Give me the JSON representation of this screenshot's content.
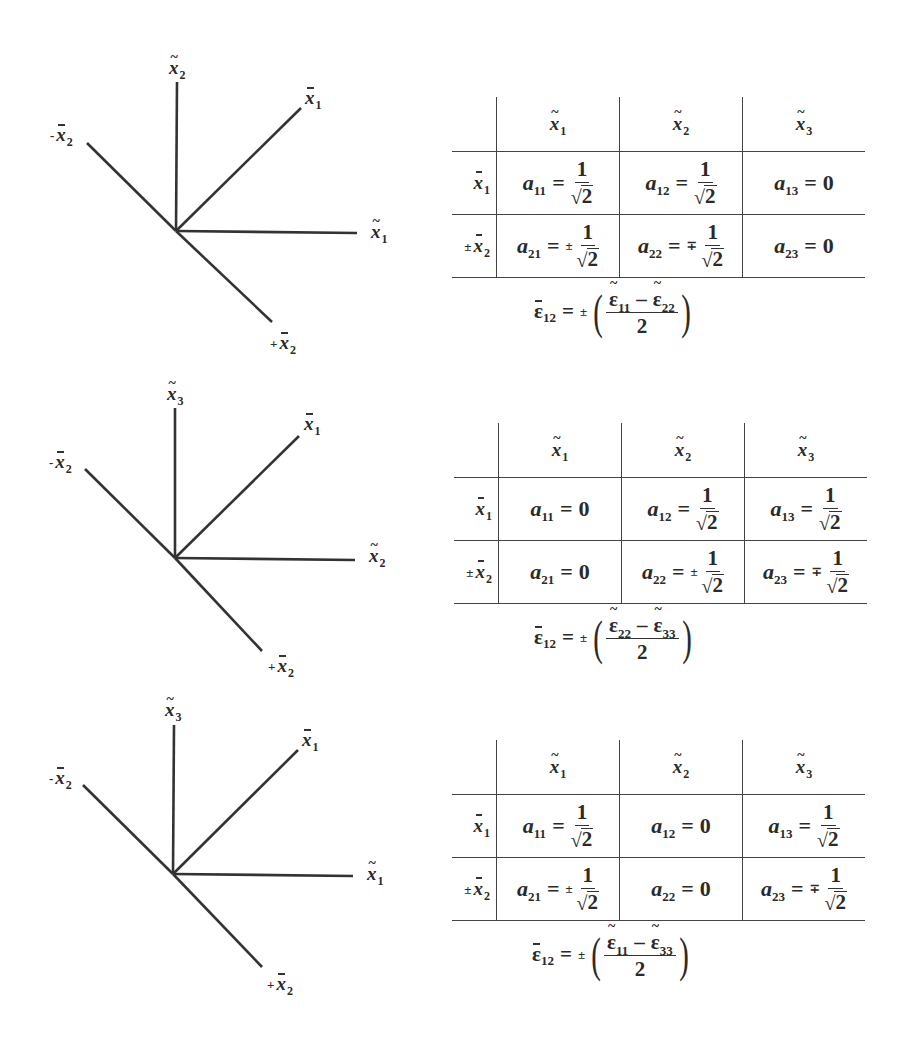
{
  "panels": [
    {
      "id": "case-1",
      "top": 0,
      "diagram": {
        "origin": [
          176,
          231
        ],
        "lines": [
          {
            "name": "vertical-axis",
            "to": [
              177,
              82
            ]
          },
          {
            "name": "xbar1-axis",
            "to": [
              301,
              108
            ]
          },
          {
            "name": "horizontal-axis",
            "to": [
              357,
              233
            ]
          },
          {
            "name": "minus-xbar2-axis",
            "to": [
              87,
              143
            ]
          },
          {
            "name": "plus-xbar2-axis",
            "to": [
              272,
              322
            ]
          }
        ],
        "labels": {
          "vertical": {
            "mark": "~",
            "base": "x",
            "sub": "2",
            "sign": "",
            "pos": [
              169,
              58
            ]
          },
          "xbar1": {
            "mark": "bar",
            "base": "x",
            "sub": "1",
            "sign": "",
            "pos": [
              305,
              88
            ]
          },
          "horizontal": {
            "mark": "~",
            "base": "x",
            "sub": "1",
            "sign": "",
            "pos": [
              371,
              222
            ]
          },
          "minus": {
            "mark": "bar",
            "base": "x",
            "sub": "2",
            "sign": "-",
            "pos": [
              50,
              125
            ]
          },
          "plus": {
            "mark": "bar",
            "base": "x",
            "sub": "2",
            "sign": "+",
            "pos": [
              270,
              333
            ]
          }
        }
      },
      "table": {
        "pos": [
          452,
          97
        ],
        "columns": [
          {
            "mark": "~",
            "base": "x",
            "sub": "1"
          },
          {
            "mark": "~",
            "base": "x",
            "sub": "2"
          },
          {
            "mark": "~",
            "base": "x",
            "sub": "3"
          }
        ],
        "rows": [
          {
            "header": {
              "sign": "",
              "mark": "bar",
              "base": "x",
              "sub": "1"
            },
            "cells": [
              {
                "a": "a",
                "idx": "11",
                "sign": "",
                "num": "1",
                "den": "2",
                "value": ""
              },
              {
                "a": "a",
                "idx": "12",
                "sign": "",
                "num": "1",
                "den": "2",
                "value": ""
              },
              {
                "a": "a",
                "idx": "13",
                "sign": "",
                "num": "",
                "den": "",
                "value": "0"
              }
            ]
          },
          {
            "header": {
              "sign": "±",
              "mark": "bar",
              "base": "x",
              "sub": "2"
            },
            "cells": [
              {
                "a": "a",
                "idx": "21",
                "sign": "±",
                "num": "1",
                "den": "2",
                "value": ""
              },
              {
                "a": "a",
                "idx": "22",
                "sign": "∓",
                "num": "1",
                "den": "2",
                "value": ""
              },
              {
                "a": "a",
                "idx": "23",
                "sign": "",
                "num": "",
                "den": "",
                "value": "0"
              }
            ]
          }
        ]
      },
      "formula": {
        "lhs": "ε",
        "lhs_sub": "12",
        "eq": "=",
        "sign": "±",
        "t1": "ε",
        "t1_sub": "11",
        "minus": "–",
        "t2": "ε",
        "t2_sub": "22",
        "den": "2",
        "pos": [
          534,
          286
        ]
      }
    },
    {
      "id": "case-2",
      "top": 0,
      "diagram": {
        "origin": [
          175,
          558
        ],
        "lines": [
          {
            "name": "vertical-axis",
            "to": [
              175,
              408
            ]
          },
          {
            "name": "xbar1-axis",
            "to": [
              299,
              436
            ]
          },
          {
            "name": "horizontal-axis",
            "to": [
              355,
              560
            ]
          },
          {
            "name": "minus-xbar2-axis",
            "to": [
              85,
              469
            ]
          },
          {
            "name": "plus-xbar2-axis",
            "to": [
              262,
              651
            ]
          }
        ],
        "labels": {
          "vertical": {
            "mark": "~",
            "base": "x",
            "sub": "3",
            "sign": "",
            "pos": [
              167,
              384
            ]
          },
          "xbar1": {
            "mark": "bar",
            "base": "x",
            "sub": "1",
            "sign": "",
            "pos": [
              304,
              414
            ]
          },
          "horizontal": {
            "mark": "~",
            "base": "x",
            "sub": "2",
            "sign": "",
            "pos": [
              369,
              546
            ]
          },
          "minus": {
            "mark": "bar",
            "base": "x",
            "sub": "2",
            "sign": "-",
            "pos": [
              49,
              452
            ]
          },
          "plus": {
            "mark": "bar",
            "base": "x",
            "sub": "2",
            "sign": "+",
            "pos": [
              268,
              656
            ]
          }
        }
      },
      "table": {
        "pos": [
          454,
          423
        ],
        "columns": [
          {
            "mark": "~",
            "base": "x",
            "sub": "1"
          },
          {
            "mark": "~",
            "base": "x",
            "sub": "2"
          },
          {
            "mark": "~",
            "base": "x",
            "sub": "3"
          }
        ],
        "rows": [
          {
            "header": {
              "sign": "",
              "mark": "bar",
              "base": "x",
              "sub": "1"
            },
            "cells": [
              {
                "a": "a",
                "idx": "11",
                "sign": "",
                "num": "",
                "den": "",
                "value": "0"
              },
              {
                "a": "a",
                "idx": "12",
                "sign": "",
                "num": "1",
                "den": "2",
                "value": ""
              },
              {
                "a": "a",
                "idx": "13",
                "sign": "",
                "num": "1",
                "den": "2",
                "value": ""
              }
            ]
          },
          {
            "header": {
              "sign": "±",
              "mark": "bar",
              "base": "x",
              "sub": "2"
            },
            "cells": [
              {
                "a": "a",
                "idx": "21",
                "sign": "",
                "num": "",
                "den": "",
                "value": "0"
              },
              {
                "a": "a",
                "idx": "22",
                "sign": "±",
                "num": "1",
                "den": "2",
                "value": ""
              },
              {
                "a": "a",
                "idx": "23",
                "sign": "∓",
                "num": "1",
                "den": "2",
                "value": ""
              }
            ]
          }
        ]
      },
      "formula": {
        "lhs": "ε",
        "lhs_sub": "12",
        "eq": "=",
        "sign": "±",
        "t1": "ε",
        "t1_sub": "22",
        "minus": "–",
        "t2": "ε",
        "t2_sub": "33",
        "den": "2",
        "pos": [
          534,
          612
        ]
      }
    },
    {
      "id": "case-3",
      "top": 0,
      "diagram": {
        "origin": [
          173,
          874
        ],
        "lines": [
          {
            "name": "vertical-axis",
            "to": [
              174,
              725
            ]
          },
          {
            "name": "xbar1-axis",
            "to": [
              298,
              750
            ]
          },
          {
            "name": "horizontal-axis",
            "to": [
              353,
              876
            ]
          },
          {
            "name": "minus-xbar2-axis",
            "to": [
              83,
              785
            ]
          },
          {
            "name": "plus-xbar2-axis",
            "to": [
              262,
              967
            ]
          }
        ],
        "labels": {
          "vertical": {
            "mark": "~",
            "base": "x",
            "sub": "3",
            "sign": "",
            "pos": [
              165,
              700
            ]
          },
          "xbar1": {
            "mark": "bar",
            "base": "x",
            "sub": "1",
            "sign": "",
            "pos": [
              302,
              730
            ]
          },
          "horizontal": {
            "mark": "~",
            "base": "x",
            "sub": "1",
            "sign": "",
            "pos": [
              367,
              864
            ]
          },
          "minus": {
            "mark": "bar",
            "base": "x",
            "sub": "2",
            "sign": "-",
            "pos": [
              49,
              768
            ]
          },
          "plus": {
            "mark": "bar",
            "base": "x",
            "sub": "2",
            "sign": "+",
            "pos": [
              267,
              974
            ]
          }
        }
      },
      "table": {
        "pos": [
          452,
          740
        ],
        "columns": [
          {
            "mark": "~",
            "base": "x",
            "sub": "1"
          },
          {
            "mark": "~",
            "base": "x",
            "sub": "2"
          },
          {
            "mark": "~",
            "base": "x",
            "sub": "3"
          }
        ],
        "rows": [
          {
            "header": {
              "sign": "",
              "mark": "bar",
              "base": "x",
              "sub": "1"
            },
            "cells": [
              {
                "a": "a",
                "idx": "11",
                "sign": "",
                "num": "1",
                "den": "2",
                "value": ""
              },
              {
                "a": "a",
                "idx": "12",
                "sign": "",
                "num": "",
                "den": "",
                "value": "0"
              },
              {
                "a": "a",
                "idx": "13",
                "sign": "",
                "num": "1",
                "den": "2",
                "value": ""
              }
            ]
          },
          {
            "header": {
              "sign": "±",
              "mark": "bar",
              "base": "x",
              "sub": "2"
            },
            "cells": [
              {
                "a": "a",
                "idx": "21",
                "sign": "±",
                "num": "1",
                "den": "2",
                "value": ""
              },
              {
                "a": "a",
                "idx": "22",
                "sign": "",
                "num": "",
                "den": "",
                "value": "0"
              },
              {
                "a": "a",
                "idx": "23",
                "sign": "∓",
                "num": "1",
                "den": "2",
                "value": ""
              }
            ]
          }
        ]
      },
      "formula": {
        "lhs": "ε",
        "lhs_sub": "12",
        "eq": "=",
        "sign": "±",
        "t1": "ε",
        "t1_sub": "11",
        "minus": "–",
        "t2": "ε",
        "t2_sub": "33",
        "den": "2",
        "pos": [
          532,
          929
        ]
      }
    }
  ],
  "symbols": {
    "tilde": "~",
    "radical": "√",
    "equals": "=",
    "open_paren": "(",
    "close_paren": ")"
  },
  "colors": {
    "ink": "#2a2a2a",
    "rule": "#444444",
    "background": "#ffffff"
  }
}
